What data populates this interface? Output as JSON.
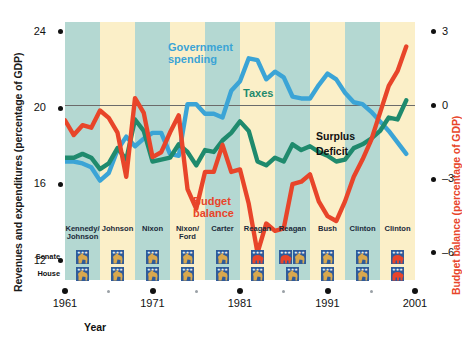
{
  "axes": {
    "left_title": "Revenues and expenditures (percentage of GDP)",
    "right_title": "Budget balance (percentage of GDP)",
    "x_title": "Year",
    "left_ticks": [
      "24",
      "20",
      "16",
      "12"
    ],
    "right_ticks": [
      "3",
      "0",
      "–3",
      "–6"
    ],
    "x_ticks": [
      "1961",
      "1971",
      "1981",
      "1991",
      "2001"
    ]
  },
  "series_labels": {
    "spending": "Government\nspending",
    "spending_line1": "Government",
    "spending_line2": "spending",
    "taxes": "Taxes",
    "budget_line1": "Budget",
    "budget_line2": "balance",
    "surplus": "Surplus",
    "deficit": "Deficit"
  },
  "colors": {
    "spending": "#3ba4d6",
    "taxes": "#1f8a6d",
    "budget": "#e8452a",
    "band_teal": "#b4d8d2",
    "band_cream": "#fbefc8",
    "zero_line": "#6b6b6b",
    "democrat": "#d9a84e",
    "republican": "#e8452a",
    "badge_field": "#2f5b9a"
  },
  "congress_rows": {
    "senate": "Senate",
    "house": "House"
  },
  "administrations": [
    {
      "name": "Kennedy/\nJohnson",
      "name_lines": [
        "Kennedy/",
        "Johnson"
      ],
      "start": 1961,
      "end": 1965,
      "senate": [
        "democrat"
      ],
      "house": [
        "democrat"
      ]
    },
    {
      "name": "Johnson",
      "name_lines": [
        "Johnson"
      ],
      "start": 1965,
      "end": 1969,
      "senate": [
        "democrat"
      ],
      "house": [
        "democrat"
      ]
    },
    {
      "name": "Nixon",
      "name_lines": [
        "Nixon"
      ],
      "start": 1969,
      "end": 1973,
      "senate": [
        "democrat"
      ],
      "house": [
        "democrat"
      ]
    },
    {
      "name": "Nixon/\nFord",
      "name_lines": [
        "Nixon/",
        "Ford"
      ],
      "start": 1973,
      "end": 1977,
      "senate": [
        "democrat"
      ],
      "house": [
        "democrat"
      ]
    },
    {
      "name": "Carter",
      "name_lines": [
        "Carter"
      ],
      "start": 1977,
      "end": 1981,
      "senate": [
        "democrat"
      ],
      "house": [
        "democrat"
      ]
    },
    {
      "name": "Reagan",
      "name_lines": [
        "Reagan"
      ],
      "start": 1981,
      "end": 1985,
      "senate": [
        "republican"
      ],
      "house": [
        "democrat"
      ]
    },
    {
      "name": "Reagan",
      "name_lines": [
        "Reagan"
      ],
      "start": 1985,
      "end": 1989,
      "senate": [
        "republican",
        "democrat"
      ],
      "house": [
        "democrat"
      ]
    },
    {
      "name": "Bush",
      "name_lines": [
        "Bush"
      ],
      "start": 1989,
      "end": 1993,
      "senate": [
        "democrat"
      ],
      "house": [
        "democrat"
      ]
    },
    {
      "name": "Clinton",
      "name_lines": [
        "Clinton"
      ],
      "start": 1993,
      "end": 1997,
      "senate": [
        "democrat"
      ],
      "house": [
        "democrat"
      ]
    },
    {
      "name": "Clinton",
      "name_lines": [
        "Clinton"
      ],
      "start": 1997,
      "end": 2001,
      "senate": [
        "republican"
      ],
      "house": [
        "republican"
      ]
    }
  ],
  "chart_data": {
    "type": "line",
    "title": "",
    "xlabel": "Year",
    "ylabel": "Revenues and expenditures (percentage of GDP)",
    "ylabel_right": "Budget balance (percentage of GDP)",
    "xlim": [
      1961,
      2001
    ],
    "ylim": [
      11.0,
      24.5
    ],
    "ylim_right": [
      -7.1,
      3.4
    ],
    "yticks": [
      24,
      20,
      16,
      12
    ],
    "yticks_right": [
      3,
      0,
      -3,
      -6
    ],
    "xticks": [
      1961,
      1971,
      1981,
      1991,
      2001
    ],
    "grid": false,
    "legend": "inline annotations",
    "annotations": [
      "Government spending",
      "Taxes",
      "Budget balance",
      "Surplus",
      "Deficit"
    ],
    "zero_reference_line_right_axis": 0,
    "series": [
      {
        "name": "Government spending",
        "color": "#3ba4d6",
        "axis": "left",
        "x": [
          1961,
          1962,
          1963,
          1964,
          1965,
          1966,
          1967,
          1968,
          1969,
          1970,
          1971,
          1972,
          1973,
          1974,
          1975,
          1976,
          1977,
          1978,
          1979,
          1980,
          1981,
          1982,
          1983,
          1984,
          1985,
          1986,
          1987,
          1988,
          1989,
          1990,
          1991,
          1992,
          1993,
          1994,
          1995,
          1996,
          1997,
          1998,
          1999,
          2000
        ],
        "values": [
          17.2,
          17.2,
          17.1,
          16.9,
          16.2,
          16.6,
          17.8,
          18.5,
          18.0,
          18.4,
          18.7,
          18.7,
          17.6,
          17.5,
          20.2,
          20.2,
          19.7,
          19.7,
          19.5,
          20.9,
          21.4,
          22.6,
          22.5,
          21.5,
          21.9,
          21.6,
          20.6,
          20.5,
          20.5,
          21.2,
          21.8,
          21.5,
          20.8,
          20.3,
          20.2,
          19.8,
          19.3,
          18.8,
          18.2,
          17.6
        ]
      },
      {
        "name": "Taxes",
        "color": "#1f8a6d",
        "axis": "left",
        "x": [
          1961,
          1962,
          1963,
          1964,
          1965,
          1966,
          1967,
          1968,
          1969,
          1970,
          1971,
          1972,
          1973,
          1974,
          1975,
          1976,
          1977,
          1978,
          1979,
          1980,
          1981,
          1982,
          1983,
          1984,
          1985,
          1986,
          1987,
          1988,
          1989,
          1990,
          1991,
          1992,
          1993,
          1994,
          1995,
          1996,
          1997,
          1998,
          1999,
          2000
        ],
        "values": [
          17.4,
          17.4,
          17.6,
          17.4,
          16.8,
          17.1,
          17.9,
          17.3,
          19.4,
          18.8,
          17.2,
          17.3,
          17.4,
          18.1,
          17.7,
          17.0,
          17.8,
          17.7,
          18.3,
          18.7,
          19.3,
          18.8,
          17.2,
          17.0,
          17.4,
          17.2,
          18.1,
          17.8,
          18.0,
          17.7,
          17.5,
          17.2,
          17.3,
          17.9,
          18.1,
          18.4,
          18.8,
          19.5,
          19.4,
          20.4
        ]
      },
      {
        "name": "Budget balance",
        "color": "#e8452a",
        "axis": "right",
        "x": [
          1961,
          1962,
          1963,
          1964,
          1965,
          1966,
          1967,
          1968,
          1969,
          1970,
          1971,
          1972,
          1973,
          1974,
          1975,
          1976,
          1977,
          1978,
          1979,
          1980,
          1981,
          1982,
          1983,
          1984,
          1985,
          1986,
          1987,
          1988,
          1989,
          1990,
          1991,
          1992,
          1993,
          1994,
          1995,
          1996,
          1997,
          1998,
          1999,
          2000
        ],
        "values": [
          -0.6,
          -1.2,
          -0.8,
          -0.9,
          -0.2,
          -0.5,
          -1.1,
          -2.9,
          0.3,
          -0.3,
          -2.1,
          -1.9,
          -1.1,
          -0.4,
          -3.4,
          -4.2,
          -2.7,
          -2.7,
          -1.6,
          -2.7,
          -2.6,
          -4.0,
          -6.0,
          -4.8,
          -5.1,
          -5.0,
          -3.2,
          -3.1,
          -2.8,
          -3.9,
          -4.5,
          -4.7,
          -3.9,
          -2.9,
          -2.2,
          -1.4,
          -0.3,
          0.8,
          1.4,
          2.4
        ]
      }
    ]
  }
}
